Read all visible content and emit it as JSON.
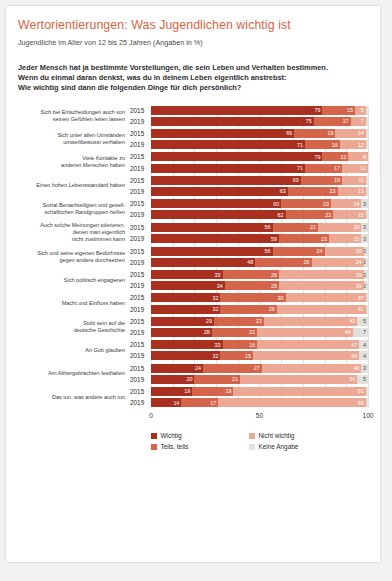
{
  "header": {
    "title": "Wertorientierungen: Was Jugendlichen wichtig ist",
    "subtitle": "Jugendliche im Alter von 12 bis 25 Jahren (Angaben in %)",
    "question_line1": "Jeder Mensch hat ja bestimmte Vorstellungen, die sein Leben und Verhalten bestimmen.",
    "question_line2": "Wenn du einmal daran denkst, was du in deinem Leben eigentlich anstrebst:",
    "question_line3": "Wie wichtig sind dann die folgenden Dinge für dich persönlich?"
  },
  "colors": {
    "wichtig": "#a9301f",
    "teils_teils": "#d4644a",
    "nicht_wichtig": "#eda893",
    "keine_angabe": "#e0e0dc",
    "accent": "#d9633f",
    "grid": "#e2e2e2"
  },
  "chart_data": {
    "type": "bar",
    "orientation": "horizontal",
    "stacked": true,
    "title": "Wertorientierungen: Was Jugendlichen wichtig ist",
    "subtitle": "Jugendliche im Alter von 12 bis 25 Jahren (Angaben in %)",
    "xlabel": "",
    "ylabel": "",
    "xlim": [
      0,
      100
    ],
    "xticks": [
      0,
      50,
      100
    ],
    "xtick_labels": [
      "0",
      "50",
      "100"
    ],
    "grid": true,
    "legend_position": "bottom",
    "series": [
      {
        "name": "Wichtig",
        "color": "#a9301f"
      },
      {
        "name": "Teils, teils",
        "color": "#d4644a"
      },
      {
        "name": "Nicht wichtig",
        "color": "#eda893"
      },
      {
        "name": "Keine Angabe",
        "color": "#e0e0dc"
      }
    ],
    "groups": [
      {
        "label_lines": [
          "Sich bei Entscheidungen auch von",
          "seinen Gefühlen leiten lassen"
        ],
        "rows": [
          {
            "year": "2015",
            "values": [
              79,
              15,
              5,
              1
            ]
          },
          {
            "year": "2019",
            "values": [
              75,
              17,
              7,
              1
            ]
          }
        ]
      },
      {
        "label_lines": [
          "Sich unter allen Umständen",
          "umweltbewusst verhalten"
        ],
        "rows": [
          {
            "year": "2015",
            "values": [
              66,
              19,
              14,
              1
            ]
          },
          {
            "year": "2019",
            "values": [
              71,
              16,
              12,
              1
            ]
          }
        ]
      },
      {
        "label_lines": [
          "Viele Kontakte zu",
          "anderen Menschen haben"
        ],
        "rows": [
          {
            "year": "2015",
            "values": [
              79,
              12,
              9,
              0
            ]
          },
          {
            "year": "2019",
            "values": [
              71,
              17,
              12,
              0
            ]
          }
        ]
      },
      {
        "label_lines": [
          "Einen hohen Lebensstandard haben"
        ],
        "rows": [
          {
            "year": "2015",
            "values": [
              69,
              19,
              11,
              1
            ]
          },
          {
            "year": "2019",
            "values": [
              63,
              23,
              13,
              1
            ]
          }
        ]
      },
      {
        "label_lines": [
          "Sozial Benachteiligten und gesell-",
          "schaftlichen Randgruppen helfen"
        ],
        "rows": [
          {
            "year": "2015",
            "values": [
              60,
              23,
              14,
              3
            ]
          },
          {
            "year": "2019",
            "values": [
              62,
              22,
              15,
              1
            ]
          }
        ]
      },
      {
        "label_lines": [
          "Auch solche Meinungen tolerieren,",
          "denen man eigentlich",
          "nicht zustimmen kann"
        ],
        "rows": [
          {
            "year": "2015",
            "values": [
              56,
              21,
              20,
              3
            ]
          },
          {
            "year": "2019",
            "values": [
              59,
              23,
              15,
              3
            ]
          }
        ]
      },
      {
        "label_lines": [
          "Sich und seine eigenen Bedürfnisse",
          "gegen andere durchsetzen"
        ],
        "rows": [
          {
            "year": "2015",
            "values": [
              56,
              24,
              18,
              2
            ]
          },
          {
            "year": "2019",
            "values": [
              48,
              26,
              24,
              2
            ]
          }
        ]
      },
      {
        "label_lines": [
          "Sich politisch engagieren"
        ],
        "rows": [
          {
            "year": "2015",
            "values": [
              33,
              26,
              39,
              2
            ]
          },
          {
            "year": "2019",
            "values": [
              34,
              25,
              39,
              2
            ]
          }
        ]
      },
      {
        "label_lines": [
          "Macht und Einfluss haben"
        ],
        "rows": [
          {
            "year": "2015",
            "values": [
              32,
              30,
              37,
              1
            ]
          },
          {
            "year": "2019",
            "values": [
              32,
              26,
              41,
              1
            ]
          }
        ]
      },
      {
        "label_lines": [
          "Stolz sein auf die",
          "deutsche Geschichte"
        ],
        "rows": [
          {
            "year": "2015",
            "values": [
              29,
              23,
              43,
              5
            ]
          },
          {
            "year": "2019",
            "values": [
              28,
              21,
              44,
              7
            ]
          }
        ]
      },
      {
        "label_lines": [
          "An Gott glauben"
        ],
        "rows": [
          {
            "year": "2015",
            "values": [
              33,
              16,
              47,
              4
            ]
          },
          {
            "year": "2019",
            "values": [
              32,
              15,
              49,
              4
            ]
          }
        ]
      },
      {
        "label_lines": [
          "Am Althergebrachten festhalten"
        ],
        "rows": [
          {
            "year": "2015",
            "values": [
              24,
              27,
              46,
              3
            ]
          },
          {
            "year": "2019",
            "values": [
              20,
              21,
              54,
              5
            ]
          }
        ]
      },
      {
        "label_lines": [
          "Das tun, was andere auch tun"
        ],
        "rows": [
          {
            "year": "2015",
            "values": [
              19,
              19,
              61,
              1
            ]
          },
          {
            "year": "2019",
            "values": [
              14,
              17,
              68,
              1
            ]
          }
        ]
      }
    ]
  },
  "legend": [
    {
      "label": "Wichtig",
      "color": "#a9301f"
    },
    {
      "label": "Nicht wichtig",
      "color": "#eda893"
    },
    {
      "label": "Teils, teils",
      "color": "#d4644a"
    },
    {
      "label": "Keine Angabe",
      "color": "#e0e0dc"
    }
  ]
}
